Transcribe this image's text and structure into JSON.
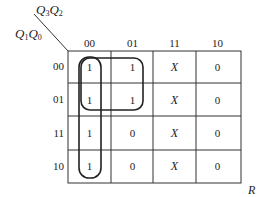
{
  "kmap": {
    "col_var": [
      "Q",
      "3",
      "Q",
      "2"
    ],
    "row_var": [
      "Q",
      "1",
      "Q",
      "0"
    ],
    "col_headers": [
      "00",
      "01",
      "11",
      "10"
    ],
    "row_headers": [
      "00",
      "01",
      "11",
      "10"
    ],
    "cells": [
      [
        "1",
        "1",
        "X",
        "0"
      ],
      [
        "1",
        "1",
        "X",
        "0"
      ],
      [
        "1",
        "0",
        "X",
        "0"
      ],
      [
        "1",
        "0",
        "X",
        "0"
      ]
    ],
    "output_label": "R",
    "groups": [
      {
        "name": "column-00-group",
        "covers": "Q3'Q2'"
      },
      {
        "name": "quad-group",
        "covers": "Q3'Q1'"
      }
    ]
  }
}
